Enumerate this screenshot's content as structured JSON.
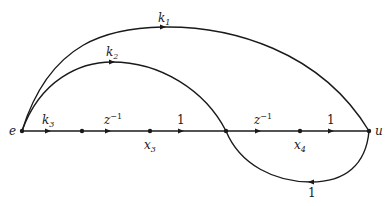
{
  "diagram": {
    "type": "signal-flow-graph",
    "nodes": [
      {
        "id": "e",
        "label": "e",
        "x": 22,
        "y": 131
      },
      {
        "id": "n1",
        "label": "",
        "x": 82,
        "y": 131
      },
      {
        "id": "x3",
        "label": "x",
        "sub": "3",
        "x": 150,
        "y": 131
      },
      {
        "id": "n2",
        "label": "",
        "x": 226,
        "y": 131
      },
      {
        "id": "x4",
        "label": "x",
        "sub": "4",
        "x": 300,
        "y": 131
      },
      {
        "id": "u",
        "label": "u",
        "x": 369,
        "y": 131
      }
    ],
    "edges": [
      {
        "from": "e",
        "to": "n1",
        "gain": "k",
        "gain_sub": "3"
      },
      {
        "from": "n1",
        "to": "x3",
        "gain": "z",
        "gain_sup": "−1"
      },
      {
        "from": "x3",
        "to": "n2",
        "gain": "1"
      },
      {
        "from": "n2",
        "to": "x4",
        "gain": "z",
        "gain_sup": "−1"
      },
      {
        "from": "x4",
        "to": "u",
        "gain": "1"
      },
      {
        "from": "e",
        "to": "u",
        "gain": "k",
        "gain_sub": "1",
        "shape": "upper-arc"
      },
      {
        "from": "e",
        "to": "n2",
        "gain": "k",
        "gain_sub": "2",
        "shape": "inner-arc"
      },
      {
        "from": "u",
        "to": "n2",
        "gain": "1",
        "shape": "lower-loop"
      }
    ],
    "labels": {
      "e": "e",
      "u": "u",
      "x3": "x",
      "x3_sub": "3",
      "x4": "x",
      "x4_sub": "4",
      "k1": "k",
      "k1_sub": "1",
      "k2": "k",
      "k2_sub": "2",
      "k3": "k",
      "k3_sub": "3",
      "z1": "z",
      "z1_sup": "−1",
      "z2": "z",
      "z2_sup": "−1",
      "one_a": "1",
      "one_b": "1",
      "one_loop": "1"
    },
    "colors": {
      "ink": "#1a1a1a",
      "background": "#ffffff"
    }
  }
}
